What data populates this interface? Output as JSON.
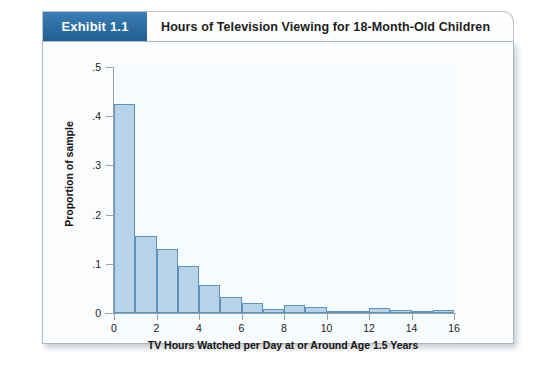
{
  "exhibit": {
    "badge_label": "Exhibit 1.1",
    "title": "Hours of Television Viewing for 18-Month-Old Children",
    "badge_color": "#2b6ca3",
    "bar_fill_color": "#b7d3ea",
    "bar_border_color": "#5d93bd",
    "panel_background": "#fafcfd",
    "plot_background": "#f6fbfd"
  },
  "chart_data": {
    "type": "bar",
    "title": "Hours of Television Viewing for 18-Month-Old Children",
    "subtitle": "",
    "xlabel": "TV Hours Watched per Day at or Around Age 1.5 Years",
    "ylabel": "Proportion of sample",
    "xlim": [
      0,
      16
    ],
    "ylim": [
      0,
      0.5
    ],
    "grid": false,
    "legend": "none",
    "xtick_labels": [
      "0",
      "2",
      "4",
      "6",
      "8",
      "10",
      "12",
      "14",
      "16"
    ],
    "xtick_values": [
      0,
      2,
      4,
      6,
      8,
      10,
      12,
      14,
      16
    ],
    "ytick_labels": [
      ".5",
      ".4",
      ".3",
      ".2",
      ".1",
      "0"
    ],
    "ytick_values": [
      0.5,
      0.4,
      0.3,
      0.2,
      0.1,
      0
    ],
    "bin_width": 1,
    "bin_starts": [
      0,
      1,
      2,
      3,
      4,
      5,
      6,
      7,
      8,
      9,
      10,
      11,
      12,
      13,
      14,
      15
    ],
    "categories": [
      "0-1",
      "1-2",
      "2-3",
      "3-4",
      "4-5",
      "5-6",
      "6-7",
      "7-8",
      "8-9",
      "9-10",
      "10-11",
      "11-12",
      "12-13",
      "13-14",
      "14-15",
      "15-16"
    ],
    "values": [
      0.425,
      0.157,
      0.131,
      0.096,
      0.057,
      0.033,
      0.021,
      0.008,
      0.016,
      0.013,
      0.005,
      0.004,
      0.011,
      0.006,
      0.004,
      0.006
    ]
  }
}
